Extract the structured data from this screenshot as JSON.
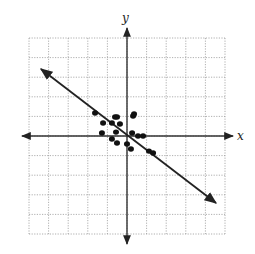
{
  "chart_data": {
    "type": "scatter",
    "title": "",
    "xlabel": "x",
    "ylabel": "y",
    "grid": true,
    "grid_style": "dotted",
    "xlim": [
      -5,
      5
    ],
    "ylim": [
      -5,
      5
    ],
    "tick_labels": false,
    "points": [
      {
        "x": -1.63,
        "y": 1.17
      },
      {
        "x": -1.22,
        "y": 0.66
      },
      {
        "x": -1.28,
        "y": 0.15
      },
      {
        "x": -0.61,
        "y": 0.97
      },
      {
        "x": -0.51,
        "y": 0.97
      },
      {
        "x": -0.77,
        "y": 0.66
      },
      {
        "x": -0.36,
        "y": 0.61
      },
      {
        "x": -0.56,
        "y": 0.2
      },
      {
        "x": -0.77,
        "y": -0.15
      },
      {
        "x": -0.51,
        "y": -0.36
      },
      {
        "x": 0.36,
        "y": 1.12
      },
      {
        "x": 0.31,
        "y": 1.02
      },
      {
        "x": 0.26,
        "y": 0.15
      },
      {
        "x": 0.0,
        "y": -0.41
      },
      {
        "x": 0.2,
        "y": -0.66
      },
      {
        "x": 0.56,
        "y": 0.0
      },
      {
        "x": 0.82,
        "y": 0.0
      },
      {
        "x": 1.12,
        "y": -0.77
      },
      {
        "x": 1.33,
        "y": -0.87
      }
    ],
    "trend_line": {
      "from": {
        "x": -4.39,
        "y": 3.42
      },
      "to": {
        "x": 4.54,
        "y": -3.42
      },
      "arrows": "both"
    }
  },
  "labels": {
    "x_axis": "x",
    "y_axis": "y"
  }
}
